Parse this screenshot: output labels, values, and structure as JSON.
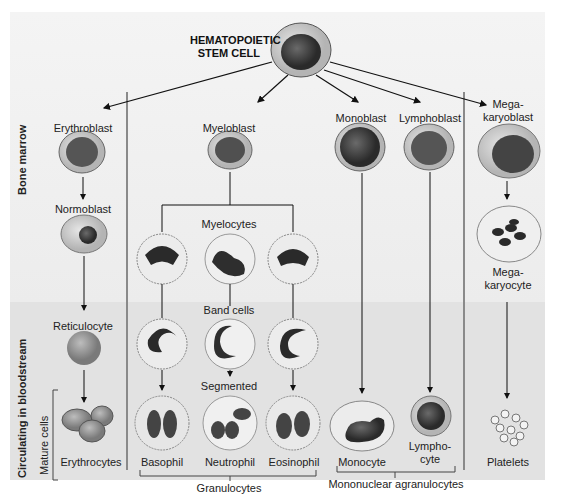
{
  "title": {
    "line1": "HEMATOPOIETIC",
    "line2": "STEM CELL"
  },
  "zones": {
    "bone_marrow": "Bone marrow",
    "bloodstream": "Circulating in bloodstream",
    "mature": "Mature cells"
  },
  "erythroid": {
    "erythroblast": "Erythroblast",
    "normoblast": "Normoblast",
    "reticulocyte": "Reticulocyte",
    "erythrocytes": "Erythrocytes"
  },
  "myeloid": {
    "myeloblast": "Myeloblast",
    "myelocytes": "Myelocytes",
    "band_cells": "Band cells",
    "segmented": "Segmented",
    "basophil": "Basophil",
    "neutrophil": "Neutrophil",
    "eosinophil": "Eosinophil",
    "granulocytes": "Granulocytes"
  },
  "mono": {
    "monoblast": "Monoblast",
    "monocyte": "Monocyte"
  },
  "lympho": {
    "lymphoblast": "Lymphoblast",
    "lymphocyte_1": "Lympho-",
    "lymphocyte_2": "cyte",
    "group": "Mononuclear agranulocytes"
  },
  "mega": {
    "megakaryoblast_1": "Mega-",
    "megakaryoblast_2": "karyoblast",
    "megakaryocyte_1": "Mega-",
    "megakaryocyte_2": "karyocyte",
    "platelets": "Platelets"
  },
  "colors": {
    "bg_top": "#f0f0f0",
    "bg_bottom": "#e2e2e2",
    "divider": "#8a8a8a",
    "nucleus": "#3a3a3a",
    "cytoplasm": "#c8c8c8"
  }
}
